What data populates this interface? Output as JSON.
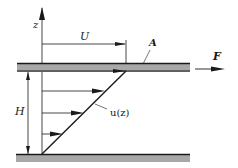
{
  "diagram": {
    "labels": {
      "z_axis": "z",
      "plate_velocity": "U",
      "plate_area": "A",
      "force": "F",
      "gap_height": "H",
      "velocity_profile": "u(z)"
    },
    "colors": {
      "plate_fill": "#a8a8a8",
      "plate_edge": "#1a1a1a",
      "line": "#1a1a1a",
      "background": "#ffffff"
    },
    "elements": {
      "upper_plate": {
        "moving": true
      },
      "lower_plate": {
        "moving": false
      },
      "velocity_arrows_count": 3
    }
  }
}
